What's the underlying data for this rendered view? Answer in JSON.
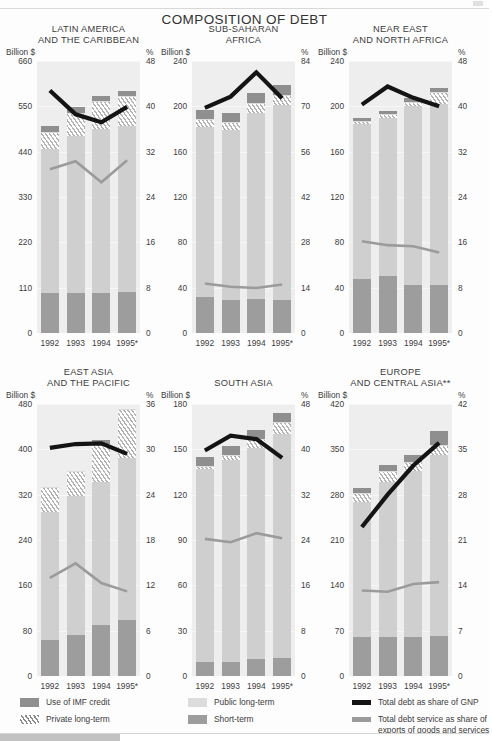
{
  "page": {
    "main_title": "COMPOSITION OF DEBT",
    "billion_label": "Billion $",
    "percent_label": "%"
  },
  "legend": {
    "items": [
      {
        "key": "imf",
        "label": "Use of IMF credit",
        "color": "#8f8f8f"
      },
      {
        "key": "priv",
        "label": "Private long-term",
        "color": "#8a8a8a"
      },
      {
        "key": "pub",
        "label": "Public long-term",
        "color": "#dcdcdc"
      },
      {
        "key": "short",
        "label": "Short-term",
        "color": "#9d9d9d"
      },
      {
        "key": "gnp",
        "label": "Total debt as share of GNP",
        "color": "#141414"
      },
      {
        "key": "service",
        "label": "Total debt service as share of exports of goods and services",
        "color": "#9b9b9b"
      }
    ]
  },
  "chart_data": [
    {
      "type": "bar",
      "id": "latin-america",
      "title": "LATIN AMERICA\nAND THE CARIBBEAN",
      "title_lines": [
        "LATIN AMERICA",
        "AND THE CARIBBEAN"
      ],
      "categories": [
        "1992",
        "1993",
        "1994",
        "1995*"
      ],
      "ylabel": "Billion $",
      "y2label": "%",
      "ylim": [
        0,
        660
      ],
      "yticks": [
        0,
        110,
        220,
        330,
        440,
        550,
        660
      ],
      "y2lim": [
        0,
        48
      ],
      "y2ticks": [
        0,
        8,
        16,
        24,
        32,
        40,
        48
      ],
      "grid": true,
      "series": [
        {
          "name": "Short-term",
          "stack": true,
          "values": [
            96,
            96,
            98,
            100
          ]
        },
        {
          "name": "Public long-term",
          "stack": true,
          "values": [
            350,
            382,
            396,
            402
          ]
        },
        {
          "name": "Private long-term",
          "stack": true,
          "values": [
            42,
            56,
            68,
            72
          ]
        },
        {
          "name": "Use of IMF credit",
          "stack": true,
          "values": [
            14,
            14,
            14,
            14
          ]
        }
      ],
      "line_series": [
        {
          "name": "Total debt as share of GNP",
          "axis": "right",
          "color": "#141414",
          "values": [
            42.8,
            38.6,
            37.2,
            39.9
          ]
        },
        {
          "name": "Total debt service as share of exports of goods and services",
          "axis": "right",
          "color": "#9b9b9b",
          "values": [
            28.9,
            30.3,
            26.6,
            30.5
          ]
        }
      ]
    },
    {
      "type": "bar",
      "id": "sub-saharan-africa",
      "title": "SUB-SAHARAN\nAFRICA",
      "title_lines": [
        "SUB-SAHARAN",
        "AFRICA"
      ],
      "categories": [
        "1992",
        "1993",
        "1994",
        "1995*"
      ],
      "ylabel": "Billion $",
      "y2label": "%",
      "ylim": [
        0,
        240
      ],
      "yticks": [
        0,
        40,
        80,
        120,
        160,
        200,
        240
      ],
      "y2lim": [
        0,
        84
      ],
      "y2ticks": [
        0,
        14,
        28,
        42,
        56,
        70,
        84
      ],
      "grid": true,
      "series": [
        {
          "name": "Short-term",
          "stack": true,
          "values": [
            32,
            29,
            30,
            29
          ]
        },
        {
          "name": "Public long-term",
          "stack": true,
          "values": [
            150,
            150,
            164,
            172
          ]
        },
        {
          "name": "Private long-term",
          "stack": true,
          "values": [
            7,
            7,
            9,
            9
          ]
        },
        {
          "name": "Use of IMF credit",
          "stack": true,
          "values": [
            8,
            8,
            9,
            9
          ]
        }
      ],
      "line_series": [
        {
          "name": "Total debt as share of GNP",
          "axis": "right",
          "color": "#141414",
          "values": [
            69.5,
            73.0,
            80.5,
            72.5
          ]
        },
        {
          "name": "Total debt service as share of exports of goods and services",
          "axis": "right",
          "color": "#9b9b9b",
          "values": [
            15.3,
            14.3,
            13.9,
            15.0
          ]
        }
      ]
    },
    {
      "type": "bar",
      "id": "near-east-north-africa",
      "title": "NEAR EAST\nAND NORTH AFRICA",
      "title_lines": [
        "NEAR EAST",
        "AND NORTH AFRICA"
      ],
      "categories": [
        "1992",
        "1993",
        "1994",
        "1995*"
      ],
      "ylabel": "Billion $",
      "y2label": "%",
      "ylim": [
        0,
        240
      ],
      "yticks": [
        0,
        40,
        80,
        120,
        160,
        200,
        240
      ],
      "y2lim": [
        0,
        48
      ],
      "y2ticks": [
        0,
        8,
        16,
        24,
        32,
        40,
        48
      ],
      "grid": true,
      "series": [
        {
          "name": "Short-term",
          "stack": true,
          "values": [
            48,
            50,
            42,
            42
          ]
        },
        {
          "name": "Public long-term",
          "stack": true,
          "values": [
            136,
            140,
            158,
            160
          ]
        },
        {
          "name": "Private long-term",
          "stack": true,
          "values": [
            3,
            3,
            4,
            11
          ]
        },
        {
          "name": "Use of IMF credit",
          "stack": true,
          "values": [
            3,
            3,
            3,
            3
          ]
        }
      ],
      "line_series": [
        {
          "name": "Total debt as share of GNP",
          "axis": "right",
          "color": "#141414",
          "values": [
            40.3,
            43.5,
            41.5,
            40.0
          ]
        },
        {
          "name": "Total debt service as share of exports of goods and services",
          "axis": "right",
          "color": "#9b9b9b",
          "values": [
            16.2,
            15.5,
            15.3,
            14.2
          ]
        }
      ]
    },
    {
      "type": "bar",
      "id": "east-asia-pacific",
      "title": "EAST ASIA\nAND THE PACIFIC",
      "title_lines": [
        "EAST ASIA",
        "AND THE PACIFIC"
      ],
      "categories": [
        "1992",
        "1993",
        "1994",
        "1995*"
      ],
      "ylabel": "Billion $",
      "y2label": "%",
      "ylim": [
        0,
        480
      ],
      "yticks": [
        0,
        80,
        160,
        240,
        320,
        400,
        480
      ],
      "y2lim": [
        0,
        36
      ],
      "y2ticks": [
        0,
        6,
        12,
        18,
        24,
        30,
        36
      ],
      "grid": true,
      "series": [
        {
          "name": "Short-term",
          "stack": true,
          "values": [
            64,
            72,
            90,
            98
          ]
        },
        {
          "name": "Public long-term",
          "stack": true,
          "values": [
            226,
            246,
            252,
            286
          ]
        },
        {
          "name": "Private long-term",
          "stack": true,
          "values": [
            44,
            44,
            68,
            88
          ]
        },
        {
          "name": "Use of IMF credit",
          "stack": true,
          "values": [
            0,
            0,
            6,
            0
          ]
        }
      ],
      "line_series": [
        {
          "name": "Total debt as share of GNP",
          "axis": "right",
          "color": "#141414",
          "values": [
            30.2,
            30.7,
            30.8,
            29.4
          ]
        },
        {
          "name": "Total debt service as share of exports of goods and services",
          "axis": "right",
          "color": "#9b9b9b",
          "values": [
            13.0,
            14.9,
            12.3,
            11.2
          ]
        }
      ]
    },
    {
      "type": "bar",
      "id": "south-asia",
      "title": "SOUTH ASIA",
      "title_lines": [
        "SOUTH ASIA"
      ],
      "categories": [
        "1992",
        "1993",
        "1994",
        "1995*"
      ],
      "ylabel": "Billion $",
      "y2label": "%",
      "ylim": [
        0,
        180
      ],
      "yticks": [
        0,
        30,
        60,
        90,
        120,
        150,
        180
      ],
      "y2lim": [
        0,
        48
      ],
      "y2ticks": [
        0,
        8,
        16,
        24,
        32,
        40,
        48
      ],
      "grid": true,
      "series": [
        {
          "name": "Short-term",
          "stack": true,
          "values": [
            9,
            9,
            11,
            12
          ]
        },
        {
          "name": "Public long-term",
          "stack": true,
          "values": [
            128,
            134,
            140,
            148
          ]
        },
        {
          "name": "Private long-term",
          "stack": true,
          "values": [
            2,
            3,
            6,
            8
          ]
        },
        {
          "name": "Use of IMF credit",
          "stack": true,
          "values": [
            6,
            6,
            6,
            6
          ]
        }
      ],
      "line_series": [
        {
          "name": "Total debt as share of GNP",
          "axis": "right",
          "color": "#141414",
          "values": [
            39.8,
            42.4,
            41.8,
            38.5
          ]
        },
        {
          "name": "Total debt service as share of exports of goods and services",
          "axis": "right",
          "color": "#9b9b9b",
          "values": [
            24.2,
            23.6,
            25.2,
            24.3
          ]
        }
      ]
    },
    {
      "type": "bar",
      "id": "europe-central-asia",
      "title": "EUROPE\nAND CENTRAL ASIA**",
      "title_lines": [
        "EUROPE",
        "AND CENTRAL ASIA**"
      ],
      "categories": [
        "1992",
        "1993",
        "1994",
        "1995*"
      ],
      "ylabel": "Billion $",
      "y2label": "%",
      "ylim": [
        0,
        420
      ],
      "yticks": [
        0,
        70,
        140,
        210,
        280,
        350,
        420
      ],
      "y2lim": [
        0,
        42
      ],
      "y2ticks": [
        0,
        7,
        14,
        21,
        28,
        35,
        42
      ],
      "grid": true,
      "series": [
        {
          "name": "Short-term",
          "stack": true,
          "values": [
            60,
            60,
            60,
            62
          ]
        },
        {
          "name": "Public long-term",
          "stack": true,
          "values": [
            208,
            240,
            256,
            280
          ]
        },
        {
          "name": "Private long-term",
          "stack": true,
          "values": [
            14,
            16,
            14,
            14
          ]
        },
        {
          "name": "Use of IMF credit",
          "stack": true,
          "values": [
            8,
            10,
            12,
            22
          ]
        }
      ],
      "line_series": [
        {
          "name": "Total debt as share of GNP",
          "axis": "right",
          "color": "#141414",
          "values": [
            23.0,
            28.0,
            32.5,
            36.0
          ]
        },
        {
          "name": "Total debt service as share of exports of goods and services",
          "axis": "right",
          "color": "#9b9b9b",
          "values": [
            13.2,
            13.0,
            14.2,
            14.5
          ]
        }
      ]
    }
  ]
}
